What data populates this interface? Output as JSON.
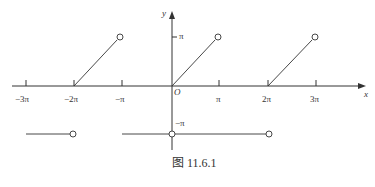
{
  "figure": {
    "caption": "图 11.6.1",
    "axes": {
      "x_label": "x",
      "y_label": "y",
      "origin_label": "O",
      "x_ticks": [
        "−3π",
        "−2π",
        "−π",
        "π",
        "2π",
        "3π"
      ],
      "y_ticks": [
        "π",
        "−π"
      ]
    },
    "segments": [
      {
        "type": "line",
        "from": [
          "-2π",
          "0"
        ],
        "to": [
          "-π",
          "π"
        ],
        "end": "open"
      },
      {
        "type": "line",
        "from": [
          "0",
          "0"
        ],
        "to": [
          "π",
          "π"
        ],
        "end": "open"
      },
      {
        "type": "line",
        "from": [
          "2π",
          "0"
        ],
        "to": [
          "3π",
          "π"
        ],
        "end": "open"
      },
      {
        "type": "line",
        "from": [
          "-3π",
          "-π"
        ],
        "to": [
          "-2π",
          "-π"
        ],
        "end": "open"
      },
      {
        "type": "line",
        "from": [
          "-π",
          "-π"
        ],
        "to": [
          "2π",
          "-π"
        ],
        "end": "open",
        "open_at": [
          "0",
          "2π"
        ]
      }
    ]
  }
}
